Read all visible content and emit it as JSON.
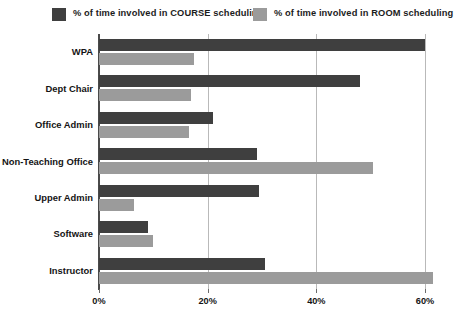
{
  "legend": {
    "position": "top",
    "entries": [
      {
        "label": "% of time involved in COURSE scheduling",
        "color": "#3f3f3f",
        "swatch_name": "legend-swatch-course"
      },
      {
        "label": "% of time involved in ROOM scheduling",
        "color": "#9b9b9b",
        "swatch_name": "legend-swatch-room"
      }
    ]
  },
  "axis": {
    "x_ticks": [
      "0%",
      "20%",
      "40%",
      "60%"
    ],
    "x_tick_values": [
      0,
      20,
      40,
      60
    ]
  },
  "chart_data": {
    "type": "bar",
    "orientation": "horizontal",
    "title": "",
    "subtitle": "",
    "xlabel": "",
    "ylabel": "",
    "xlim": [
      0,
      61.5
    ],
    "ylim": null,
    "grid": true,
    "grid_axis": "x",
    "legend_position": "top",
    "categories": [
      "WPA",
      "Dept Chair",
      "Office Admin",
      "Non-Teaching Office",
      "Upper Admin",
      "Software",
      "Instructor"
    ],
    "series": [
      {
        "name": "% of time involved in COURSE scheduling",
        "color": "#3f3f3f",
        "values": [
          60,
          48,
          21,
          29,
          29.5,
          9,
          30.5
        ]
      },
      {
        "name": "% of time involved in ROOM scheduling",
        "color": "#9b9b9b",
        "values": [
          17.5,
          17,
          16.5,
          50.5,
          6.5,
          10,
          61.5
        ]
      }
    ],
    "tick_labels": [
      "0%",
      "20%",
      "40%",
      "60%"
    ],
    "annotations": []
  },
  "colors": {
    "course": "#3f3f3f",
    "room": "#9b9b9b",
    "gridline": "#b9b9b9",
    "axis": "#4a4a4a",
    "background": "#ffffff"
  }
}
